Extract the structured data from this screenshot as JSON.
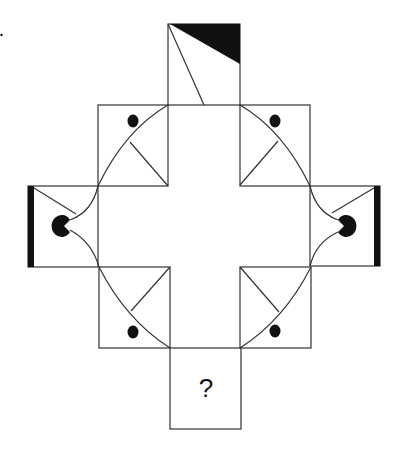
{
  "puzzle": {
    "question_mark": "?",
    "stroke_color": "#333333",
    "fill_color": "#111111",
    "background": "#ffffff"
  },
  "boxes": [
    {
      "id": "top",
      "x": 168,
      "y": 24,
      "w": 72,
      "h": 81
    },
    {
      "id": "top-left",
      "x": 98,
      "y": 105,
      "w": 70,
      "h": 81
    },
    {
      "id": "top-right",
      "x": 240,
      "y": 105,
      "w": 70,
      "h": 81
    },
    {
      "id": "left",
      "x": 28,
      "y": 186,
      "w": 70,
      "h": 81
    },
    {
      "id": "right",
      "x": 310,
      "y": 186,
      "w": 70,
      "h": 80
    },
    {
      "id": "bottom-left",
      "x": 99,
      "y": 267,
      "w": 71,
      "h": 81
    },
    {
      "id": "bottom-right",
      "x": 240,
      "y": 267,
      "w": 71,
      "h": 81
    },
    {
      "id": "bottom",
      "x": 170,
      "y": 348,
      "w": 71,
      "h": 81
    }
  ]
}
